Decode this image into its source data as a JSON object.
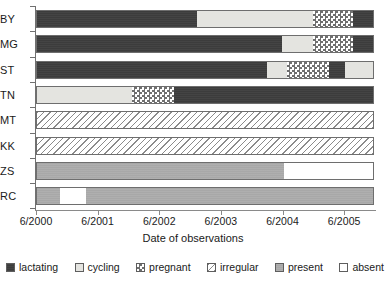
{
  "chart_data": {
    "type": "bar",
    "subtype": "horizontal-stacked-timeline",
    "title": "",
    "xlabel": "Date of observations",
    "ylabel": "",
    "grid": false,
    "legend_position": "bottom",
    "x_tick_labels": [
      "6/2000",
      "6/2001",
      "6/2002",
      "6/2003",
      "6/2004",
      "6/2005"
    ],
    "x_tick_values": [
      2000.5,
      2001.5,
      2002.5,
      2003.5,
      2004.5,
      2005.5
    ],
    "xlim": [
      2000.5,
      2006.0
    ],
    "categories": [
      "BY",
      "MG",
      "ST",
      "TN",
      "MT",
      "KK",
      "ZS",
      "RC"
    ],
    "states": [
      "lactating",
      "cycling",
      "pregnant",
      "irregular",
      "present",
      "absent"
    ],
    "state_colors": {
      "lactating": "#3c3c3c",
      "cycling": "#e4e4e0",
      "pregnant": "#ffffff",
      "irregular": "#ffffff",
      "present": "#a8a8a8",
      "absent": "#ffffff"
    },
    "series": [
      {
        "name": "BY",
        "segments": [
          {
            "state": "lactating",
            "start": 2000.5,
            "end": 2003.12
          },
          {
            "state": "cycling",
            "start": 2003.12,
            "end": 2004.99
          },
          {
            "state": "pregnant",
            "start": 2004.99,
            "end": 2005.64
          },
          {
            "state": "lactating",
            "start": 2005.64,
            "end": 2005.98
          }
        ]
      },
      {
        "name": "MG",
        "segments": [
          {
            "state": "lactating",
            "start": 2000.5,
            "end": 2004.49
          },
          {
            "state": "cycling",
            "start": 2004.49,
            "end": 2004.99
          },
          {
            "state": "pregnant",
            "start": 2004.99,
            "end": 2005.64
          },
          {
            "state": "lactating",
            "start": 2005.64,
            "end": 2005.98
          }
        ]
      },
      {
        "name": "ST",
        "segments": [
          {
            "state": "lactating",
            "start": 2000.5,
            "end": 2004.24
          },
          {
            "state": "cycling",
            "start": 2004.24,
            "end": 2004.58
          },
          {
            "state": "pregnant",
            "start": 2004.58,
            "end": 2005.26
          },
          {
            "state": "lactating",
            "start": 2005.26,
            "end": 2005.52
          },
          {
            "state": "cycling",
            "start": 2005.52,
            "end": 2005.98
          }
        ]
      },
      {
        "name": "TN",
        "segments": [
          {
            "state": "cycling",
            "start": 2000.5,
            "end": 2002.06
          },
          {
            "state": "pregnant",
            "start": 2002.06,
            "end": 2002.74
          },
          {
            "state": "lactating",
            "start": 2002.74,
            "end": 2005.98
          }
        ]
      },
      {
        "name": "MT",
        "segments": [
          {
            "state": "irregular",
            "start": 2000.5,
            "end": 2005.98
          }
        ]
      },
      {
        "name": "KK",
        "segments": [
          {
            "state": "irregular",
            "start": 2000.5,
            "end": 2005.98
          }
        ]
      },
      {
        "name": "ZS",
        "segments": [
          {
            "state": "present",
            "start": 2000.5,
            "end": 2004.53
          },
          {
            "state": "absent",
            "start": 2004.53,
            "end": 2005.98
          }
        ]
      },
      {
        "name": "RC",
        "segments": [
          {
            "state": "present",
            "start": 2000.5,
            "end": 2000.89
          },
          {
            "state": "absent",
            "start": 2000.89,
            "end": 2001.31
          },
          {
            "state": "present",
            "start": 2001.31,
            "end": 2005.98
          }
        ]
      }
    ],
    "legend": [
      {
        "label": "lactating",
        "pattern": "solid-dark"
      },
      {
        "label": "cycling",
        "pattern": "solid-light"
      },
      {
        "label": "pregnant",
        "pattern": "checkerboard"
      },
      {
        "label": "irregular",
        "pattern": "diagonal-hatch"
      },
      {
        "label": "present",
        "pattern": "solid-gray"
      },
      {
        "label": "absent",
        "pattern": "empty-white"
      }
    ]
  }
}
